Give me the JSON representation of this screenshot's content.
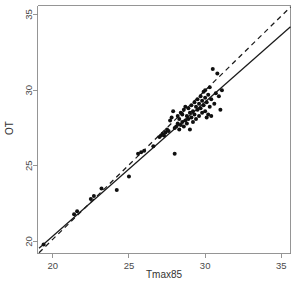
{
  "chart_data": {
    "type": "scatter",
    "title": "",
    "subtitle": "",
    "xlabel": "Tmax85",
    "ylabel": "OT",
    "xlim": [
      19.0,
      35.6
    ],
    "ylim": [
      19.2,
      35.6
    ],
    "xticks": [
      20,
      25,
      30,
      35
    ],
    "yticks": [
      20,
      25,
      30,
      35
    ],
    "xtick_labels": [
      "20",
      "25",
      "30",
      "35"
    ],
    "ytick_labels": [
      "20",
      "25",
      "30",
      "35"
    ],
    "grid": false,
    "legend": "none",
    "legend_position": "none",
    "point_color": "#101010",
    "point_size": 2.0,
    "points": [
      {
        "x": 19.4,
        "y": 19.8
      },
      {
        "x": 21.4,
        "y": 21.8
      },
      {
        "x": 21.6,
        "y": 22.0
      },
      {
        "x": 22.5,
        "y": 22.8
      },
      {
        "x": 22.7,
        "y": 23.0
      },
      {
        "x": 23.2,
        "y": 23.5
      },
      {
        "x": 24.2,
        "y": 23.4
      },
      {
        "x": 25.0,
        "y": 24.3
      },
      {
        "x": 25.6,
        "y": 25.8
      },
      {
        "x": 25.8,
        "y": 25.9
      },
      {
        "x": 26.0,
        "y": 26.0
      },
      {
        "x": 26.6,
        "y": 26.3
      },
      {
        "x": 27.0,
        "y": 26.9
      },
      {
        "x": 27.1,
        "y": 27.0
      },
      {
        "x": 27.2,
        "y": 27.1
      },
      {
        "x": 27.3,
        "y": 27.0
      },
      {
        "x": 27.4,
        "y": 27.2
      },
      {
        "x": 27.5,
        "y": 27.4
      },
      {
        "x": 27.6,
        "y": 27.3
      },
      {
        "x": 27.7,
        "y": 28.0
      },
      {
        "x": 27.8,
        "y": 28.2
      },
      {
        "x": 27.9,
        "y": 28.6
      },
      {
        "x": 28.0,
        "y": 25.8
      },
      {
        "x": 28.0,
        "y": 27.5
      },
      {
        "x": 28.1,
        "y": 27.6
      },
      {
        "x": 28.2,
        "y": 27.8
      },
      {
        "x": 28.2,
        "y": 28.3
      },
      {
        "x": 28.3,
        "y": 27.4
      },
      {
        "x": 28.3,
        "y": 28.1
      },
      {
        "x": 28.4,
        "y": 27.7
      },
      {
        "x": 28.4,
        "y": 28.5
      },
      {
        "x": 28.5,
        "y": 27.9
      },
      {
        "x": 28.5,
        "y": 28.4
      },
      {
        "x": 28.6,
        "y": 27.6
      },
      {
        "x": 28.6,
        "y": 28.7
      },
      {
        "x": 28.7,
        "y": 28.0
      },
      {
        "x": 28.7,
        "y": 28.9
      },
      {
        "x": 28.8,
        "y": 27.8
      },
      {
        "x": 28.8,
        "y": 28.3
      },
      {
        "x": 28.9,
        "y": 28.1
      },
      {
        "x": 28.9,
        "y": 28.8
      },
      {
        "x": 29.0,
        "y": 27.4
      },
      {
        "x": 29.0,
        "y": 28.5
      },
      {
        "x": 29.1,
        "y": 28.2
      },
      {
        "x": 29.1,
        "y": 29.0
      },
      {
        "x": 29.2,
        "y": 27.9
      },
      {
        "x": 29.2,
        "y": 28.6
      },
      {
        "x": 29.3,
        "y": 28.4
      },
      {
        "x": 29.3,
        "y": 29.2
      },
      {
        "x": 29.4,
        "y": 28.1
      },
      {
        "x": 29.4,
        "y": 28.9
      },
      {
        "x": 29.5,
        "y": 28.7
      },
      {
        "x": 29.5,
        "y": 29.4
      },
      {
        "x": 29.6,
        "y": 28.3
      },
      {
        "x": 29.6,
        "y": 29.1
      },
      {
        "x": 29.7,
        "y": 28.8
      },
      {
        "x": 29.7,
        "y": 29.6
      },
      {
        "x": 29.8,
        "y": 28.5
      },
      {
        "x": 29.8,
        "y": 29.3
      },
      {
        "x": 29.9,
        "y": 29.0
      },
      {
        "x": 29.9,
        "y": 29.9
      },
      {
        "x": 30.0,
        "y": 28.6
      },
      {
        "x": 30.0,
        "y": 29.5
      },
      {
        "x": 30.0,
        "y": 30.0
      },
      {
        "x": 30.1,
        "y": 28.2
      },
      {
        "x": 30.1,
        "y": 29.2
      },
      {
        "x": 30.2,
        "y": 28.4
      },
      {
        "x": 30.2,
        "y": 29.7
      },
      {
        "x": 30.3,
        "y": 28.9
      },
      {
        "x": 30.3,
        "y": 30.2
      },
      {
        "x": 30.4,
        "y": 28.3
      },
      {
        "x": 30.4,
        "y": 29.4
      },
      {
        "x": 30.5,
        "y": 31.4
      },
      {
        "x": 30.6,
        "y": 29.1
      },
      {
        "x": 30.7,
        "y": 29.8
      },
      {
        "x": 30.8,
        "y": 31.1
      },
      {
        "x": 30.9,
        "y": 29.6
      },
      {
        "x": 31.0,
        "y": 28.7
      },
      {
        "x": 31.1,
        "y": 30.0
      }
    ],
    "series": [
      {
        "name": "regression-line",
        "style": "solid",
        "color": "#101010",
        "x": [
          19.1,
          35.6
        ],
        "y": [
          19.55,
          34.2
        ]
      },
      {
        "name": "reference-line",
        "style": "dashed",
        "color": "#101010",
        "x": [
          19.1,
          35.6
        ],
        "y": [
          19.25,
          35.5
        ]
      }
    ]
  }
}
